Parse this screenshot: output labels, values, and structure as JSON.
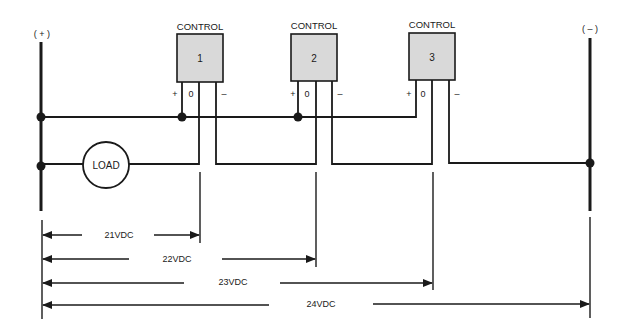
{
  "rails": {
    "positive_label": "( + )",
    "negative_label": "( – )"
  },
  "controls": [
    {
      "title": "CONTROL",
      "number": "1",
      "plus": "+",
      "zero": "0",
      "minus": "–"
    },
    {
      "title": "CONTROL",
      "number": "2",
      "plus": "+",
      "zero": "0",
      "minus": "–"
    },
    {
      "title": "CONTROL",
      "number": "3",
      "plus": "+",
      "zero": "0",
      "minus": "–"
    }
  ],
  "load": {
    "label": "LOAD"
  },
  "voltages": [
    {
      "label": "21VDC"
    },
    {
      "label": "22VDC"
    },
    {
      "label": "23VDC"
    },
    {
      "label": "24VDC"
    }
  ],
  "colors": {
    "line": "#1a1a1a",
    "box_fill": "#d9d9d9",
    "background": "#ffffff"
  }
}
